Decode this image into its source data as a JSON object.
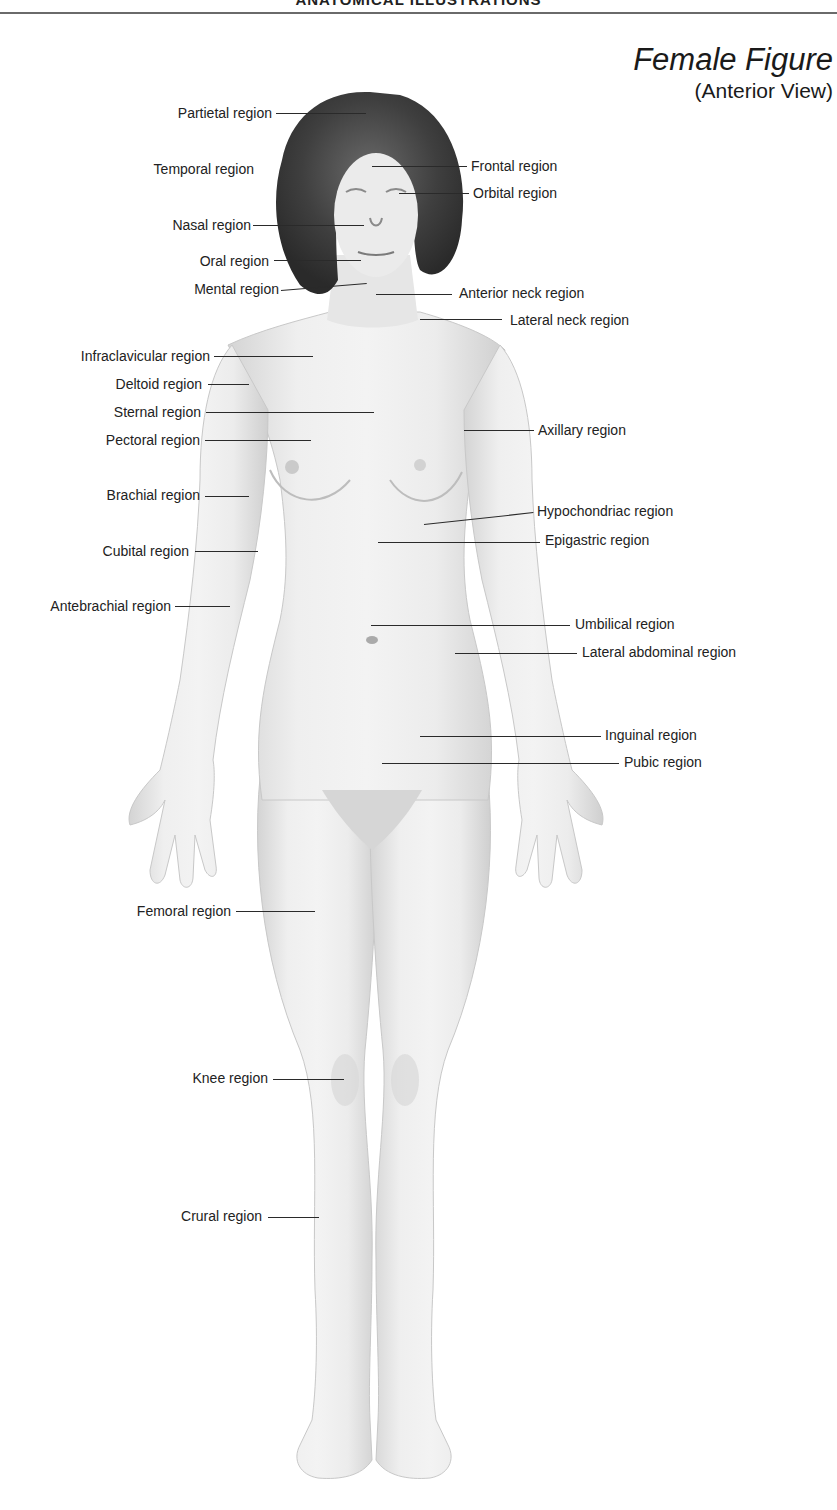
{
  "header": {
    "section_title": "ANATOMICAL ILLUSTRATIONS"
  },
  "figure": {
    "title": "Female Figure",
    "subtitle": "(Anterior View)"
  },
  "colors": {
    "text": "#222222",
    "rule": "#6a6a6a",
    "skin": "#ececec",
    "skin_shade": "#cfcfcf",
    "hair": "#3a3a3a"
  },
  "labels": {
    "left": [
      {
        "id": "partietal",
        "text": "Partietal region",
        "x2": 272,
        "y": 113,
        "lx1": 276,
        "ly1": 113,
        "lx2": 366,
        "ly2": 116
      },
      {
        "id": "temporal",
        "text": "Temporal region",
        "x2": 254,
        "y": 169,
        "lx1": null,
        "ly1": null,
        "lx2": null,
        "ly2": null
      },
      {
        "id": "nasal",
        "text": "Nasal region",
        "x2": 251,
        "y": 225,
        "lx1": 253,
        "ly1": 225,
        "lx2": 364,
        "ly2": 226
      },
      {
        "id": "oral",
        "text": "Oral region",
        "x2": 269,
        "y": 261,
        "lx1": 274,
        "ly1": 260,
        "lx2": 361,
        "ly2": 260
      },
      {
        "id": "mental",
        "text": "Mental region",
        "x2": 279,
        "y": 289,
        "lx1": 281,
        "ly1": 290,
        "lx2": 367,
        "ly2": 283
      },
      {
        "id": "infraclavicular",
        "text": "Infraclavicular region",
        "x2": 210,
        "y": 356,
        "lx1": 214,
        "ly1": 356,
        "lx2": 313,
        "ly2": 356
      },
      {
        "id": "deltoid",
        "text": "Deltoid region",
        "x2": 202,
        "y": 384,
        "lx1": 208,
        "ly1": 384,
        "lx2": 249,
        "ly2": 384
      },
      {
        "id": "sternal",
        "text": "Sternal region",
        "x2": 201,
        "y": 412,
        "lx1": 206,
        "ly1": 412,
        "lx2": 374,
        "ly2": 412
      },
      {
        "id": "pectoral",
        "text": "Pectoral region",
        "x2": 200,
        "y": 440,
        "lx1": 205,
        "ly1": 440,
        "lx2": 311,
        "ly2": 440
      },
      {
        "id": "brachial",
        "text": "Brachial region",
        "x2": 200,
        "y": 495,
        "lx1": 205,
        "ly1": 496,
        "lx2": 249,
        "ly2": 496
      },
      {
        "id": "cubital",
        "text": "Cubital region",
        "x2": 189,
        "y": 551,
        "lx1": 195,
        "ly1": 551,
        "lx2": 258,
        "ly2": 551
      },
      {
        "id": "antebrachial",
        "text": "Antebrachial region",
        "x2": 171,
        "y": 606,
        "lx1": 175,
        "ly1": 606,
        "lx2": 230,
        "ly2": 606
      },
      {
        "id": "femoral",
        "text": "Femoral region",
        "x2": 231,
        "y": 911,
        "lx1": 236,
        "ly1": 911,
        "lx2": 315,
        "ly2": 911
      },
      {
        "id": "knee",
        "text": "Knee region",
        "x2": 268,
        "y": 1078,
        "lx1": 273,
        "ly1": 1079,
        "lx2": 344,
        "ly2": 1079
      },
      {
        "id": "crural",
        "text": "Crural region",
        "x2": 262,
        "y": 1216,
        "lx1": 268,
        "ly1": 1217,
        "lx2": 319,
        "ly2": 1217
      }
    ],
    "right": [
      {
        "id": "frontal",
        "text": "Frontal region",
        "x1": 471,
        "y": 166,
        "lx1": 372,
        "ly1": 166,
        "lx2": 467,
        "ly2": 166
      },
      {
        "id": "orbital",
        "text": "Orbital region",
        "x1": 473,
        "y": 193,
        "lx1": 399,
        "ly1": 193,
        "lx2": 469,
        "ly2": 193
      },
      {
        "id": "anterior-neck",
        "text": "Anterior neck region",
        "x1": 459,
        "y": 292,
        "lx1": 376,
        "ly1": 294,
        "lx2": 452,
        "ly2": 294
      },
      {
        "id": "lateral-neck",
        "text": "Lateral neck region",
        "x1": 510,
        "y": 320,
        "lx1": 420,
        "ly1": 319,
        "lx2": 502,
        "ly2": 319
      },
      {
        "id": "axillary",
        "text": "Axillary region",
        "x1": 538,
        "y": 430,
        "lx1": 464,
        "ly1": 430,
        "lx2": 534,
        "ly2": 430
      },
      {
        "id": "hypochondriac",
        "text": "Hypochondriac region",
        "x1": 537,
        "y": 511,
        "lx1": 424,
        "ly1": 524,
        "lx2": 533,
        "ly2": 512
      },
      {
        "id": "epigastric",
        "text": "Epigastric region",
        "x1": 545,
        "y": 539,
        "lx1": 378,
        "ly1": 542,
        "lx2": 540,
        "ly2": 542
      },
      {
        "id": "umbilical",
        "text": "Umbilical region",
        "x1": 575,
        "y": 624,
        "lx1": 371,
        "ly1": 625,
        "lx2": 570,
        "ly2": 625
      },
      {
        "id": "lateral-abdominal",
        "text": "Lateral abdominal region",
        "x1": 582,
        "y": 651,
        "lx1": 455,
        "ly1": 653,
        "lx2": 577,
        "ly2": 653
      },
      {
        "id": "inguinal",
        "text": "Inguinal region",
        "x1": 605,
        "y": 734,
        "lx1": 420,
        "ly1": 736,
        "lx2": 601,
        "ly2": 736
      },
      {
        "id": "pubic",
        "text": "Pubic region",
        "x1": 624,
        "y": 761,
        "lx1": 382,
        "ly1": 763,
        "lx2": 619,
        "ly2": 763
      }
    ]
  }
}
